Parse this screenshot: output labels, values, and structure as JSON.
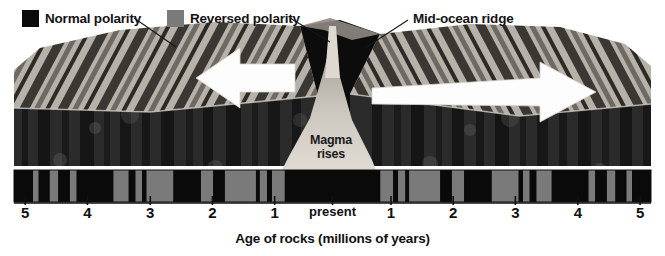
{
  "figure": {
    "background": "#ffffff"
  },
  "legend": {
    "items": [
      {
        "label": "Normal polarity",
        "color": "#0a0a0a",
        "icon": "filled-square-icon"
      },
      {
        "label": "Reversed polarity",
        "color": "#7a7a7a",
        "icon": "filled-square-icon"
      }
    ]
  },
  "callouts": {
    "ridge": "Mid-ocean ridge",
    "magma_line1": "Magma",
    "magma_line2": "rises"
  },
  "axis": {
    "caption": "Age of rocks (millions of years)",
    "ticks": [
      {
        "label": "5",
        "x": 0.038
      },
      {
        "label": "4",
        "x": 0.1315
      },
      {
        "label": "3",
        "x": 0.226
      },
      {
        "label": "2",
        "x": 0.3195
      },
      {
        "label": "1",
        "x": 0.413
      },
      {
        "label": "present",
        "x": 0.5
      },
      {
        "label": "1",
        "x": 0.588
      },
      {
        "label": "2",
        "x": 0.6815
      },
      {
        "label": "3",
        "x": 0.775
      },
      {
        "label": "4",
        "x": 0.869
      },
      {
        "label": "5",
        "x": 0.9625
      }
    ]
  },
  "colors": {
    "normal": "#0a0a0a",
    "reversed": "#7a7a7a",
    "rock_dark": "#1c1c1c",
    "rock_mid": "#4a4a4a",
    "rock_light": "#8d8d8d",
    "top_light": "#b4b0a8",
    "top_mid": "#8a8680",
    "arrow": "#fdfdfd",
    "magma": "#cfcac2",
    "leader": "#161616",
    "axis_line": "#111111"
  },
  "chart_data": {
    "type": "bar",
    "xlabel": "Age of rocks (millions of years)",
    "ylabel": "",
    "xlim": [
      -5.2,
      5.2
    ],
    "grid": false,
    "legend_position": "top-left",
    "categories": [
      "Normal polarity",
      "Reversed polarity"
    ],
    "note": "Black = normal magnetic polarity, gray = reversed polarity. Pattern is mirror-symmetric about the mid-ocean ridge (present day).",
    "stripes_right_half_myr": [
      {
        "start": 0.0,
        "end": 0.78,
        "polarity": "normal"
      },
      {
        "start": 0.78,
        "end": 0.99,
        "polarity": "reversed"
      },
      {
        "start": 0.99,
        "end": 1.07,
        "polarity": "normal"
      },
      {
        "start": 1.07,
        "end": 1.19,
        "polarity": "reversed"
      },
      {
        "start": 1.19,
        "end": 1.25,
        "polarity": "normal"
      },
      {
        "start": 1.25,
        "end": 1.76,
        "polarity": "reversed"
      },
      {
        "start": 1.76,
        "end": 1.95,
        "polarity": "normal"
      },
      {
        "start": 1.95,
        "end": 2.15,
        "polarity": "reversed"
      },
      {
        "start": 2.15,
        "end": 2.6,
        "polarity": "normal"
      },
      {
        "start": 2.6,
        "end": 3.04,
        "polarity": "reversed"
      },
      {
        "start": 3.04,
        "end": 3.11,
        "polarity": "normal"
      },
      {
        "start": 3.11,
        "end": 3.22,
        "polarity": "reversed"
      },
      {
        "start": 3.22,
        "end": 3.33,
        "polarity": "normal"
      },
      {
        "start": 3.33,
        "end": 3.58,
        "polarity": "reversed"
      },
      {
        "start": 3.58,
        "end": 4.18,
        "polarity": "normal"
      },
      {
        "start": 4.18,
        "end": 4.29,
        "polarity": "reversed"
      },
      {
        "start": 4.29,
        "end": 4.48,
        "polarity": "normal"
      },
      {
        "start": 4.48,
        "end": 4.62,
        "polarity": "reversed"
      },
      {
        "start": 4.62,
        "end": 4.8,
        "polarity": "normal"
      },
      {
        "start": 4.8,
        "end": 4.89,
        "polarity": "reversed"
      },
      {
        "start": 4.89,
        "end": 5.2,
        "polarity": "normal"
      }
    ]
  }
}
